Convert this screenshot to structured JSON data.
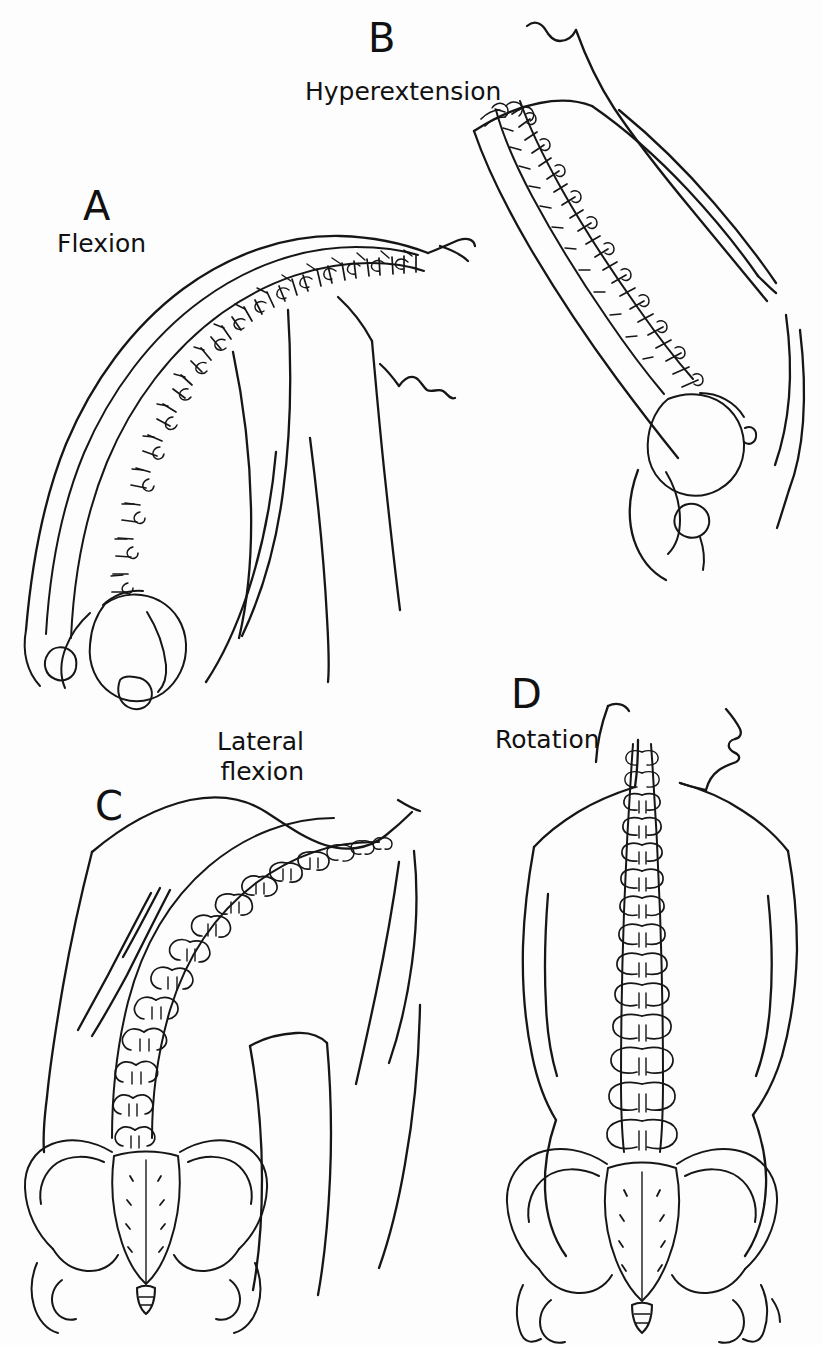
{
  "figure": {
    "background_color": "#fdfdfd",
    "ink_color": "#161616",
    "width": 823,
    "height": 1345,
    "style": "black-and-white line drawing",
    "panel_count": 4
  },
  "panels": [
    {
      "id": "a",
      "letter": "A",
      "caption": "Flexion",
      "caption_lines": [
        "Flexion"
      ],
      "view": "lateral",
      "description": "Trunk bent forward; spine forms a forward convex arc from pelvis to neck"
    },
    {
      "id": "b",
      "letter": "B",
      "caption": "Hyperextension",
      "caption_lines": [
        "Hyperextension"
      ],
      "view": "lateral",
      "description": "Trunk arched backward; spine extends from head down to pelvis"
    },
    {
      "id": "c",
      "letter": "C",
      "caption": "Lateral\nflexion",
      "caption_lines": [
        "Lateral",
        "flexion"
      ],
      "view": "posterior",
      "description": "Trunk bent sideways; spine curves laterally from sacrum upward"
    },
    {
      "id": "d",
      "letter": "D",
      "caption": "Rotation",
      "caption_lines": [
        "Rotation"
      ],
      "view": "posterior",
      "description": "Trunk twisted; head turned in profile, spine vertical"
    }
  ]
}
